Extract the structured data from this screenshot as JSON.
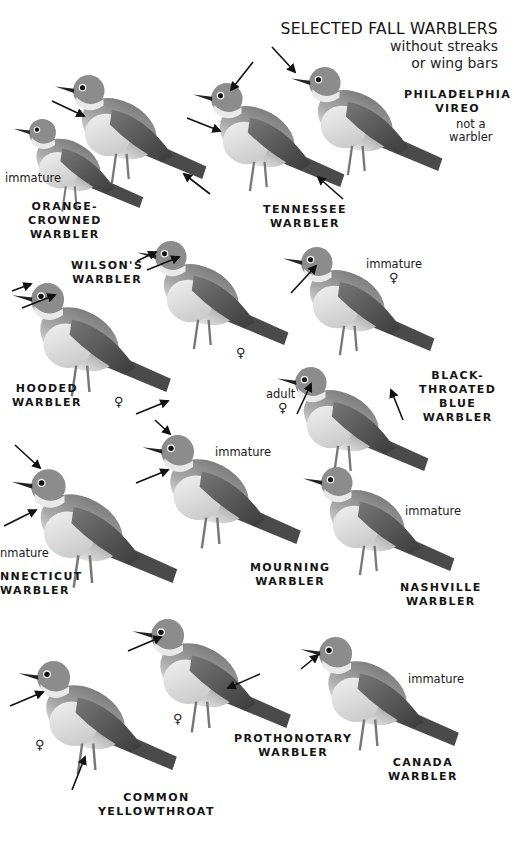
{
  "header": {
    "title": "SELECTED FALL WARBLERS",
    "subtitle_line1": "without streaks",
    "subtitle_line2": "or wing bars"
  },
  "colors": {
    "background": "#ffffff",
    "text": "#151515",
    "bird_dark": "#5a5a5a",
    "bird_mid": "#8a8a8a",
    "bird_light": "#d8d8d8",
    "arrow": "#111111"
  },
  "species": [
    {
      "id": "philadelphia-vireo",
      "name_lines": [
        "PHILADELPHIA",
        "VIREO"
      ],
      "notes": [
        "not a",
        "warbler"
      ]
    },
    {
      "id": "orange-crowned-warbler",
      "name_lines": [
        "ORANGE-",
        "CROWNED",
        "WARBLER"
      ],
      "notes": [
        "immature"
      ]
    },
    {
      "id": "tennessee-warbler",
      "name_lines": [
        "TENNESSEE",
        "WARBLER"
      ],
      "notes": []
    },
    {
      "id": "wilsons-warbler",
      "name_lines": [
        "WILSON'S",
        "WARBLER"
      ],
      "notes": [
        "♀"
      ]
    },
    {
      "id": "hooded-warbler",
      "name_lines": [
        "HOODED",
        "WARBLER"
      ],
      "notes": [
        "♀"
      ]
    },
    {
      "id": "black-throated-blue-warbler",
      "name_lines": [
        "BLACK-",
        "THROATED",
        "BLUE",
        "WARBLER"
      ],
      "notes": [
        "immature",
        "♀",
        "adult",
        "♀"
      ]
    },
    {
      "id": "connecticut-warbler",
      "name_lines": [
        "NNECTICUT",
        "WARBLER"
      ],
      "notes": [
        "nmature"
      ]
    },
    {
      "id": "mourning-warbler",
      "name_lines": [
        "MOURNING",
        "WARBLER"
      ],
      "notes": [
        "immature"
      ]
    },
    {
      "id": "nashville-warbler",
      "name_lines": [
        "NASHVILLE",
        "WARBLER"
      ],
      "notes": [
        "immature"
      ]
    },
    {
      "id": "common-yellowthroat",
      "name_lines": [
        "COMMON",
        "YELLOWTHROAT"
      ],
      "notes": [
        "♀"
      ]
    },
    {
      "id": "prothonotary-warbler",
      "name_lines": [
        "PROTHONOTARY",
        "WARBLER"
      ],
      "notes": [
        "♀"
      ]
    },
    {
      "id": "canada-warbler",
      "name_lines": [
        "CANADA",
        "WARBLER"
      ],
      "notes": [
        "immature"
      ]
    }
  ]
}
